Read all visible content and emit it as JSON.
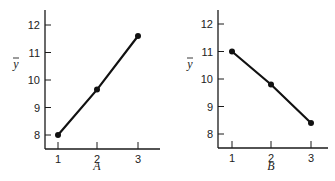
{
  "chart_data": [
    {
      "type": "line",
      "panel": "A",
      "title": "",
      "xlabel": "A",
      "ylabel": "ȳ",
      "x": [
        1,
        2,
        3
      ],
      "categories": [
        "1",
        "2",
        "3"
      ],
      "values": [
        8.0,
        9.65,
        11.6
      ],
      "yticks": [
        8,
        9,
        10,
        11,
        12
      ],
      "ytick_labels": [
        "8",
        "9",
        "10",
        "11",
        "12"
      ],
      "ylim": [
        7.5,
        12.5
      ],
      "xlim": [
        0.7,
        3.3
      ],
      "grid": false,
      "markers": true
    },
    {
      "type": "line",
      "panel": "B",
      "title": "",
      "xlabel": "B",
      "ylabel": "ȳ",
      "x": [
        1,
        2,
        3
      ],
      "categories": [
        "1",
        "2",
        "3"
      ],
      "values": [
        11.0,
        9.8,
        8.4
      ],
      "yticks": [
        8,
        9,
        10,
        11,
        12
      ],
      "ytick_labels": [
        "8",
        "9",
        "10",
        "11",
        "12"
      ],
      "ylim": [
        7.5,
        12.5
      ],
      "xlim": [
        0.7,
        3.3
      ],
      "grid": false,
      "markers": true
    }
  ],
  "panels": {
    "a": {
      "xlabel": "A",
      "ylabel": "y",
      "xticks": [
        "1",
        "2",
        "3"
      ],
      "yticks": [
        "8",
        "9",
        "10",
        "11",
        "12"
      ]
    },
    "b": {
      "xlabel": "B",
      "ylabel": "y",
      "xticks": [
        "1",
        "2",
        "3"
      ],
      "yticks": [
        "8",
        "9",
        "10",
        "11",
        "12"
      ]
    }
  },
  "colors": {
    "line": "#111111",
    "axis": "#1a1a1a",
    "background": "#ffffff"
  }
}
